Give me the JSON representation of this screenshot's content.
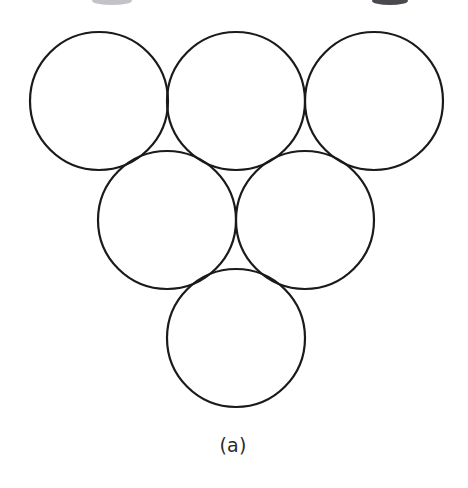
{
  "figure": {
    "caption": "(a)",
    "background_color": "#ffffff",
    "stroke_color": "#1a1a1a",
    "stroke_width": 2.2,
    "fill_color": "none",
    "width": 468,
    "height": 488,
    "description_label": "hexagonal-close-packed-circles"
  },
  "chart_data": {
    "type": "diagram",
    "title": "(a)",
    "subtitle": "",
    "xlabel": "",
    "ylabel": "",
    "grid": false,
    "legend": "none",
    "shape_type": "circle",
    "shape_count": 6,
    "radius": 69,
    "arrangement": "triangular stack: 3 circles top row, 2 circles middle row, 1 circle bottom row",
    "rows": [
      {
        "name": "top-row",
        "count": 3
      },
      {
        "name": "middle-row",
        "count": 2
      },
      {
        "name": "bottom-row",
        "count": 1
      }
    ],
    "circles": [
      {
        "id": "circle-top-left",
        "row": "top-row",
        "index": 0,
        "cx": 99,
        "cy": 101,
        "r": 69
      },
      {
        "id": "circle-top-center",
        "row": "top-row",
        "index": 1,
        "cx": 236,
        "cy": 101,
        "r": 69
      },
      {
        "id": "circle-top-right",
        "row": "top-row",
        "index": 2,
        "cx": 374,
        "cy": 101,
        "r": 69
      },
      {
        "id": "circle-middle-left",
        "row": "middle-row",
        "index": 0,
        "cx": 167,
        "cy": 220,
        "r": 69
      },
      {
        "id": "circle-middle-right",
        "row": "middle-row",
        "index": 1,
        "cx": 305,
        "cy": 220,
        "r": 69
      },
      {
        "id": "circle-bottom",
        "row": "bottom-row",
        "index": 0,
        "cx": 236,
        "cy": 338,
        "r": 69
      }
    ],
    "crop_artifacts": [
      {
        "id": "top-smudge-left",
        "cx": 112,
        "cy": 1,
        "rx": 20,
        "ry": 4,
        "color": "#b9b9bd"
      },
      {
        "id": "top-smudge-right",
        "cx": 390,
        "cy": 1,
        "rx": 18,
        "ry": 4,
        "color": "#3a3a40"
      }
    ]
  }
}
